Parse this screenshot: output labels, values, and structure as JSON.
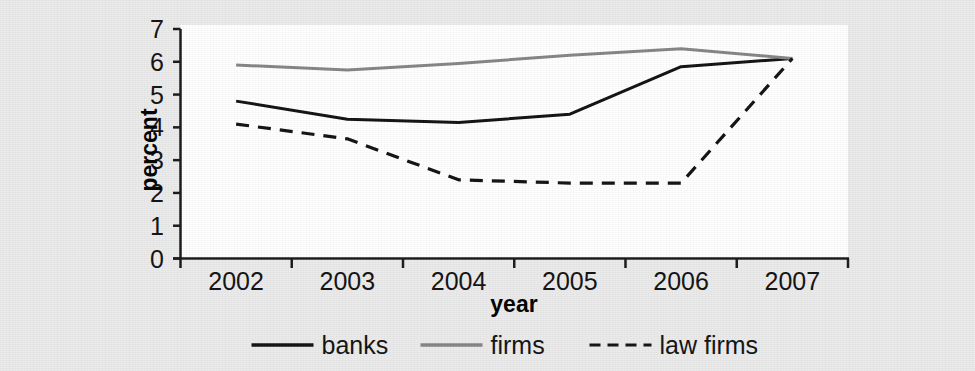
{
  "chart_data": {
    "type": "line",
    "title": "",
    "xlabel": "year",
    "ylabel": "percent",
    "categories": [
      "2002",
      "2003",
      "2004",
      "2005",
      "2006",
      "2007"
    ],
    "x": [
      2002,
      2003,
      2004,
      2005,
      2006,
      2007
    ],
    "ylim": [
      0,
      7
    ],
    "xlim": [
      "2002",
      "2007"
    ],
    "yticks": [
      "0",
      "1",
      "2",
      "3",
      "4",
      "5",
      "6",
      "7"
    ],
    "ytick_values": [
      0,
      1,
      2,
      3,
      4,
      5,
      6,
      7
    ],
    "grid": false,
    "legend_position": "bottom",
    "series": [
      {
        "name": "banks",
        "values": [
          4.8,
          4.25,
          4.15,
          4.4,
          5.85,
          6.1
        ],
        "color": "#111111",
        "style": "solid"
      },
      {
        "name": "firms",
        "values": [
          5.9,
          5.75,
          5.95,
          6.2,
          6.4,
          6.1
        ],
        "color": "#858585",
        "style": "solid"
      },
      {
        "name": "law firms",
        "values": [
          4.1,
          3.65,
          2.4,
          2.3,
          2.3,
          6.1
        ],
        "color": "#111111",
        "style": "dashed"
      }
    ]
  },
  "axes": {
    "y_title": "percent",
    "x_title": "year"
  },
  "legend": {
    "items": [
      {
        "label": "banks",
        "style": "solid",
        "color": "#111111"
      },
      {
        "label": "firms",
        "style": "solid",
        "color": "#858585"
      },
      {
        "label": "law firms",
        "style": "dashed",
        "color": "#111111"
      }
    ]
  }
}
